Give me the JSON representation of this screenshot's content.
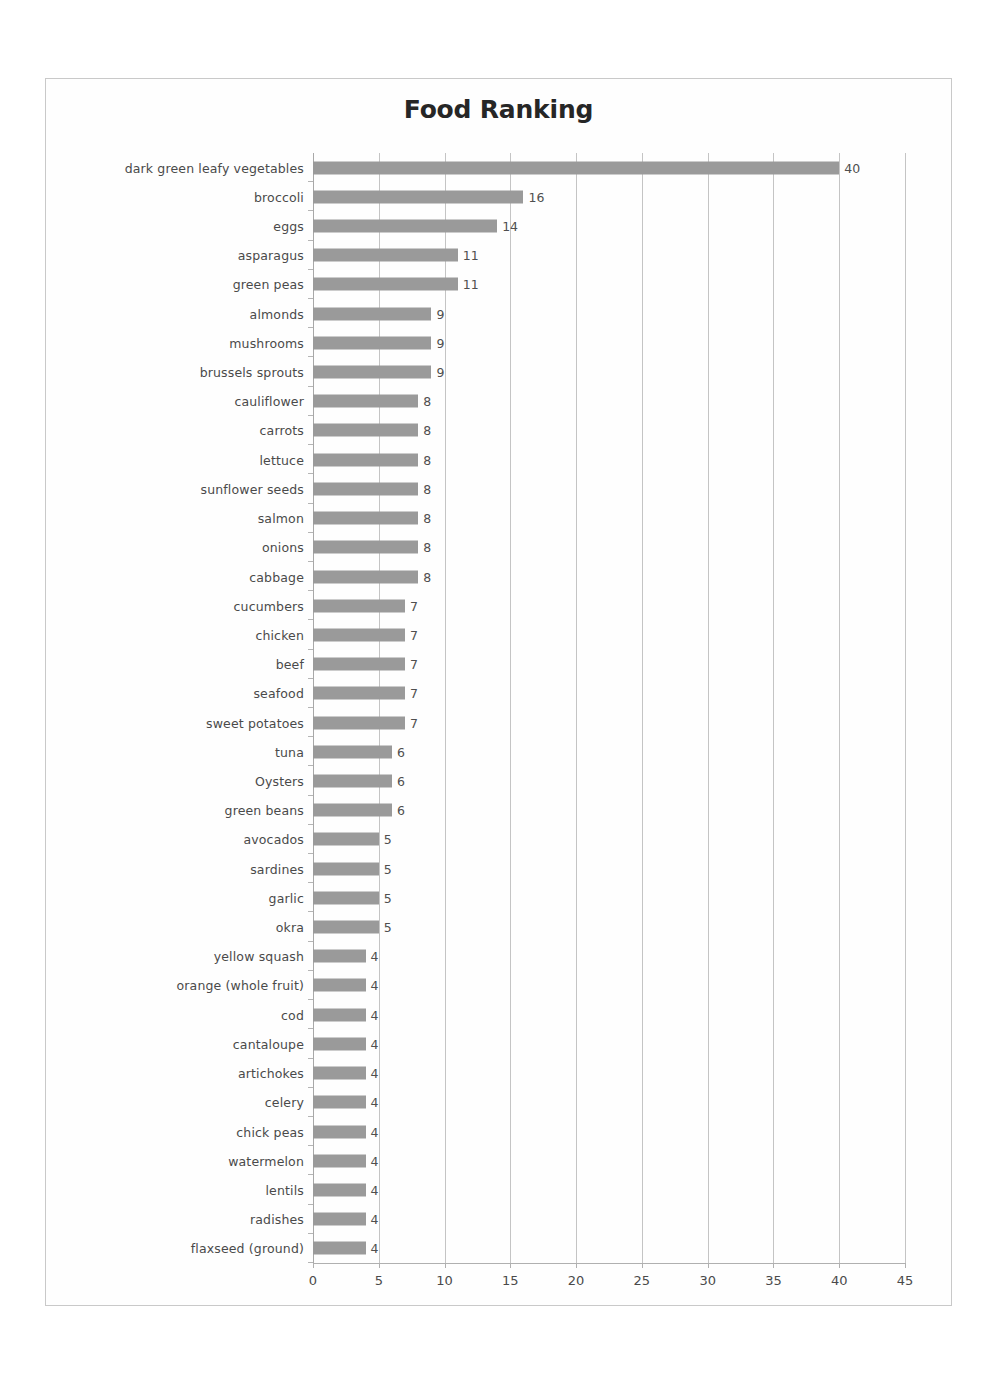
{
  "chart_data": {
    "type": "bar",
    "orientation": "horizontal",
    "title": "Food Ranking",
    "xlabel": "",
    "ylabel": "",
    "xlim": [
      0,
      45
    ],
    "xticks": [
      0,
      5,
      10,
      15,
      20,
      25,
      30,
      35,
      40,
      45
    ],
    "grid": true,
    "legend": false,
    "bar_color": "#9a9a9a",
    "show_data_labels": true,
    "categories": [
      "dark green leafy vegetables",
      "broccoli",
      "eggs",
      "asparagus",
      "green peas",
      "almonds",
      "mushrooms",
      "brussels sprouts",
      "cauliflower",
      "carrots",
      "lettuce",
      "sunflower seeds",
      "salmon",
      "onions",
      "cabbage",
      "cucumbers",
      "chicken",
      "beef",
      "seafood",
      "sweet potatoes",
      "tuna",
      "Oysters",
      "green beans",
      "avocados",
      "sardines",
      "garlic",
      "okra",
      "yellow squash",
      "orange (whole fruit)",
      "cod",
      "cantaloupe",
      "artichokes",
      "celery",
      "chick peas",
      "watermelon",
      "lentils",
      "radishes",
      "flaxseed (ground)"
    ],
    "values": [
      40,
      16,
      14,
      11,
      11,
      9,
      9,
      9,
      8,
      8,
      8,
      8,
      8,
      8,
      8,
      7,
      7,
      7,
      7,
      7,
      6,
      6,
      6,
      5,
      5,
      5,
      5,
      4,
      4,
      4,
      4,
      4,
      4,
      4,
      4,
      4,
      4,
      4
    ]
  }
}
